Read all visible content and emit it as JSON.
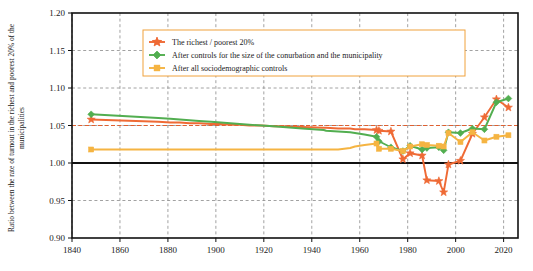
{
  "chart_data": {
    "type": "line",
    "title": "",
    "xlabel": "",
    "ylabel": "Ratio between the rate of turnout in the richest and poorest 20% of the municipalities",
    "xlim": [
      1840,
      2026
    ],
    "ylim": [
      0.9,
      1.2
    ],
    "xticks": [
      1840,
      1860,
      1880,
      1900,
      1920,
      1940,
      1960,
      1980,
      2000,
      2020
    ],
    "yticks": [
      0.9,
      0.95,
      1.0,
      1.05,
      1.1,
      1.15,
      1.2
    ],
    "ytick_labels": [
      "0.90",
      "0.95",
      "1.00",
      "1.05",
      "1.10",
      "1.15",
      "1.20"
    ],
    "xtick_labels": [
      "1840",
      "1860",
      "1880",
      "1900",
      "1920",
      "1940",
      "1960",
      "1980",
      "2000",
      "2020"
    ],
    "grid": true,
    "grid_style": "dashed",
    "legend_position": "upper center",
    "reference_lines": [
      {
        "y": 1.0,
        "color": "#111111",
        "style": "solid",
        "width": 2.2
      },
      {
        "y": 1.05,
        "color": "#e06030",
        "style": "dashed",
        "width": 1
      }
    ],
    "series": [
      {
        "name": "The richest / poorest 20%",
        "color": "#ef6a35",
        "marker": "star",
        "x": [
          1848,
          1876,
          1881,
          1885,
          1889,
          1893,
          1898,
          1902,
          1906,
          1910,
          1914,
          1919,
          1924,
          1928,
          1932,
          1936,
          1945,
          1946,
          1951,
          1956,
          1958,
          1962,
          1967,
          1968,
          1973,
          1978,
          1981,
          1986,
          1988,
          1993,
          1995,
          1997,
          2002,
          2007,
          2012,
          2017,
          2022
        ],
        "y": [
          1.058,
          1.055,
          1.054,
          1.054,
          1.053,
          1.053,
          1.052,
          1.052,
          1.051,
          1.051,
          1.05,
          1.05,
          1.049,
          1.049,
          1.048,
          1.048,
          1.047,
          1.047,
          1.046,
          1.046,
          1.045,
          1.045,
          1.044,
          1.043,
          1.042,
          1.005,
          1.013,
          1.01,
          0.977,
          0.976,
          0.961,
          0.998,
          1.003,
          1.039,
          1.061,
          1.085,
          1.074
        ]
      },
      {
        "name": "After controls for the size of the conurbation and the municipality",
        "color": "#52ae50",
        "marker": "diamond",
        "x": [
          1848,
          1876,
          1881,
          1885,
          1889,
          1893,
          1898,
          1902,
          1906,
          1910,
          1914,
          1919,
          1924,
          1928,
          1932,
          1936,
          1945,
          1946,
          1951,
          1956,
          1958,
          1962,
          1967,
          1968,
          1973,
          1978,
          1981,
          1986,
          1988,
          1993,
          1995,
          1997,
          2002,
          2007,
          2012,
          2017,
          2022
        ],
        "y": [
          1.065,
          1.06,
          1.059,
          1.058,
          1.057,
          1.056,
          1.055,
          1.054,
          1.053,
          1.052,
          1.051,
          1.05,
          1.049,
          1.048,
          1.047,
          1.046,
          1.044,
          1.043,
          1.042,
          1.041,
          1.04,
          1.038,
          1.035,
          1.029,
          1.021,
          1.016,
          1.023,
          1.018,
          1.02,
          1.021,
          1.017,
          1.041,
          1.04,
          1.046,
          1.045,
          1.081,
          1.086
        ]
      },
      {
        "name": "After all sociodemographic controls",
        "color": "#f5b442",
        "marker": "square",
        "x": [
          1848,
          1876,
          1881,
          1885,
          1889,
          1893,
          1898,
          1902,
          1906,
          1910,
          1914,
          1919,
          1924,
          1928,
          1932,
          1936,
          1945,
          1946,
          1951,
          1956,
          1958,
          1962,
          1967,
          1968,
          1973,
          1978,
          1981,
          1986,
          1988,
          1993,
          1995,
          1997,
          2002,
          2007,
          2012,
          2017,
          2022
        ],
        "y": [
          1.018,
          1.018,
          1.018,
          1.018,
          1.018,
          1.018,
          1.018,
          1.018,
          1.018,
          1.018,
          1.018,
          1.018,
          1.018,
          1.018,
          1.018,
          1.018,
          1.018,
          1.018,
          1.018,
          1.02,
          1.022,
          1.024,
          1.026,
          1.019,
          1.019,
          1.016,
          1.022,
          1.025,
          1.024,
          1.023,
          1.022,
          1.04,
          1.028,
          1.041,
          1.03,
          1.035,
          1.037
        ]
      }
    ],
    "legend": [
      {
        "label": "The richest / poorest 20%",
        "color": "#ef6a35",
        "marker": "star"
      },
      {
        "label": "After controls for the size of the conurbation and the municipality",
        "color": "#52ae50",
        "marker": "diamond"
      },
      {
        "label": "After all sociodemographic controls",
        "color": "#f5b442",
        "marker": "square"
      }
    ]
  }
}
